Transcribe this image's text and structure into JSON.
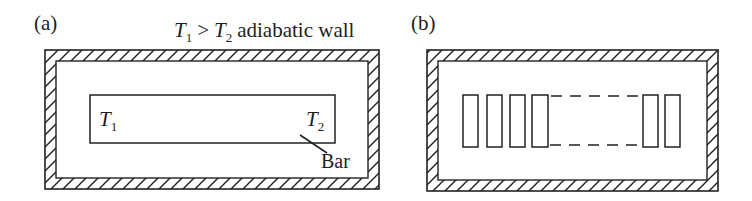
{
  "colors": {
    "line": "#222222",
    "background": "#ffffff"
  },
  "figure_a": {
    "label": "(a)",
    "title": {
      "t1_symbol": "T",
      "t1_sub": "1",
      "relation": ">",
      "t2_symbol": "T",
      "t2_sub": "2",
      "suffix": "adiabatic wall"
    },
    "temp_left": {
      "symbol": "T",
      "sub": "1"
    },
    "temp_right": {
      "symbol": "T",
      "sub": "2"
    },
    "bar_caption": "Bar"
  },
  "figure_b": {
    "label": "(b)"
  }
}
